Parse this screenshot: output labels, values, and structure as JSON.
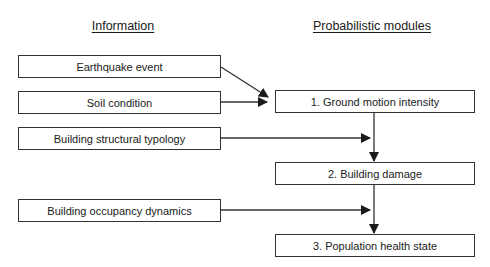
{
  "headers": {
    "information": "Information",
    "modules": "Probabilistic modules"
  },
  "information_items": [
    {
      "label": "Earthquake event"
    },
    {
      "label": "Soil condition"
    },
    {
      "label": "Building structural typology"
    },
    {
      "label": "Building occupancy dynamics"
    }
  ],
  "modules": [
    {
      "label": "1. Ground motion intensity"
    },
    {
      "label": "2. Building damage"
    },
    {
      "label": "3. Population health state"
    }
  ],
  "edges": [
    {
      "from": "Earthquake event",
      "to": "1. Ground motion intensity"
    },
    {
      "from": "Soil condition",
      "to": "1. Ground motion intensity"
    },
    {
      "from": "Building structural typology",
      "to": "2. Building damage"
    },
    {
      "from": "1. Ground motion intensity",
      "to": "2. Building damage"
    },
    {
      "from": "Building occupancy dynamics",
      "to": "3. Population health state"
    },
    {
      "from": "2. Building damage",
      "to": "3. Population health state"
    }
  ],
  "colors": {
    "stroke": "#333333",
    "text": "#1a1a1a",
    "background": "#ffffff"
  }
}
